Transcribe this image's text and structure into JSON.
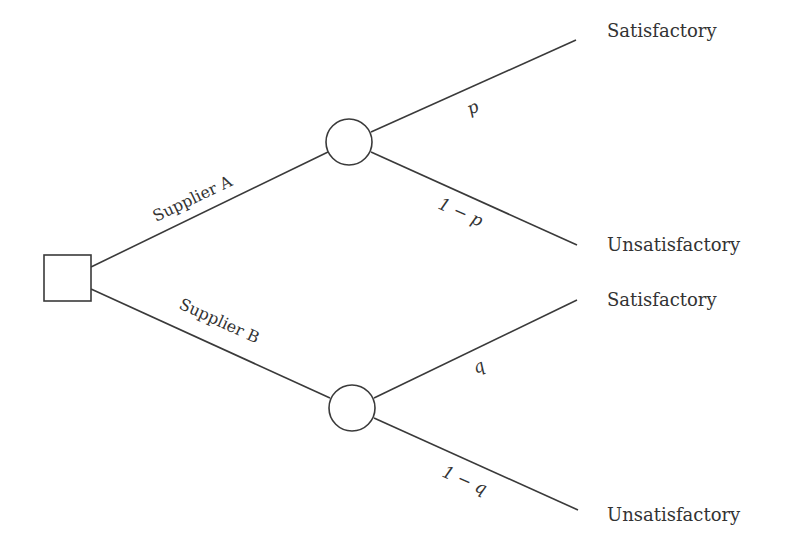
{
  "diagram": {
    "type": "decision-tree",
    "decision_node": {
      "shape": "square",
      "label": ""
    },
    "branches": [
      {
        "label": "Supplier A",
        "chance_node": {
          "shape": "circle"
        },
        "outcomes": [
          {
            "label": "Satisfactory",
            "probability": "p"
          },
          {
            "label": "Unsatisfactory",
            "probability": "1 − p"
          }
        ]
      },
      {
        "label": "Supplier B",
        "chance_node": {
          "shape": "circle"
        },
        "outcomes": [
          {
            "label": "Satisfactory",
            "probability": "q"
          },
          {
            "label": "Unsatisfactory",
            "probability": "1 − q"
          }
        ]
      }
    ]
  }
}
